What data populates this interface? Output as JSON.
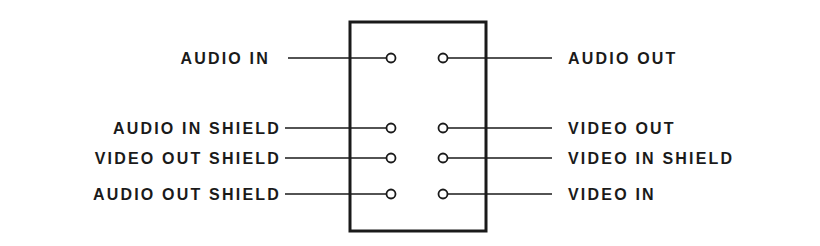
{
  "diagram": {
    "title": "",
    "connector": {
      "left_pins": [
        {
          "label": "AUDIO IN",
          "y": 58
        },
        {
          "label": "AUDIO IN SHIELD",
          "y": 128
        },
        {
          "label": "VIDEO OUT SHIELD",
          "y": 158
        },
        {
          "label": "AUDIO OUT SHIELD",
          "y": 194
        }
      ],
      "right_pins": [
        {
          "label": "AUDIO OUT",
          "y": 58
        },
        {
          "label": "VIDEO OUT",
          "y": 128
        },
        {
          "label": "VIDEO IN SHIELD",
          "y": 158
        },
        {
          "label": "VIDEO IN",
          "y": 194
        }
      ]
    },
    "colors": {
      "ink": "#1a1a1a",
      "background": "#ffffff"
    }
  }
}
